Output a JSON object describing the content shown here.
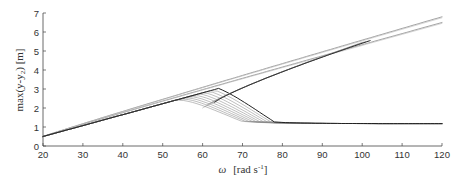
{
  "chart_data": {
    "type": "line",
    "title": "",
    "xlabel": "ω [rad s⁻¹]",
    "ylabel": "max(y-y₂) [m]",
    "xlim": [
      20,
      120
    ],
    "ylim": [
      0,
      7
    ],
    "xticks": [
      20,
      30,
      40,
      50,
      60,
      70,
      80,
      90,
      100,
      110,
      120
    ],
    "yticks": [
      0,
      1,
      2,
      3,
      4,
      5,
      6,
      7
    ],
    "grid": false,
    "legend": null,
    "series": [
      {
        "name": "upper-branch-a",
        "x": [
          20,
          40,
          60,
          80,
          100,
          120
        ],
        "y": [
          0.5,
          1.75,
          2.95,
          4.2,
          5.5,
          6.8
        ]
      },
      {
        "name": "upper-branch-b",
        "x": [
          20,
          40,
          60,
          80,
          100,
          120
        ],
        "y": [
          0.5,
          1.72,
          2.9,
          4.1,
          5.35,
          6.5
        ]
      },
      {
        "name": "fold-end",
        "x": [
          20,
          40,
          60,
          80,
          102
        ],
        "y": [
          0.5,
          1.7,
          2.85,
          4.15,
          5.5
        ]
      },
      {
        "name": "lower-branch",
        "x": [
          20,
          40,
          55,
          60,
          70,
          80,
          100,
          120
        ],
        "y": [
          0.5,
          1.65,
          2.4,
          1.8,
          1.45,
          1.32,
          1.22,
          1.2
        ]
      }
    ]
  },
  "axes": {
    "x_tick_labels": [
      "20",
      "30",
      "40",
      "50",
      "60",
      "70",
      "80",
      "90",
      "100",
      "110",
      "120"
    ],
    "y_tick_labels": [
      "0",
      "1",
      "2",
      "3",
      "4",
      "5",
      "6",
      "7"
    ],
    "xlabel_omega": "ω",
    "xlabel_unit_pre": "[rad s",
    "xlabel_unit_sup": "-1",
    "xlabel_unit_post": "]",
    "ylabel_text": "max(y-y",
    "ylabel_sub": "2",
    "ylabel_post": ") [m]"
  }
}
